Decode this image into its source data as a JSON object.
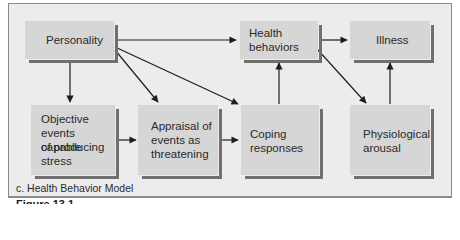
{
  "diagram": {
    "title": "c. Health Behavior Model",
    "figure_label": "Figure 13.1",
    "nodes": [
      {
        "id": "personality",
        "label": "Personality"
      },
      {
        "id": "health_behaviors",
        "label": "Health behaviors",
        "lines": [
          "Health",
          "behaviors"
        ]
      },
      {
        "id": "illness",
        "label": "Illness"
      },
      {
        "id": "objective_events",
        "label": "Objective events capable of producing stress",
        "lines": [
          "Objective",
          "events capable",
          "of producing",
          "stress"
        ]
      },
      {
        "id": "appraisal",
        "label": "Appraisal of events as threatening",
        "lines": [
          "Appraisal of",
          "events as",
          "threatening"
        ]
      },
      {
        "id": "coping",
        "label": "Coping responses",
        "lines": [
          "Coping",
          "responses"
        ]
      },
      {
        "id": "physiological_arousal",
        "label": "Physiological arousal",
        "lines": [
          "Physiological",
          "arousal"
        ]
      }
    ],
    "edges": [
      {
        "from": "personality",
        "to": "health_behaviors"
      },
      {
        "from": "personality",
        "to": "objective_events"
      },
      {
        "from": "personality",
        "to": "appraisal"
      },
      {
        "from": "personality",
        "to": "coping"
      },
      {
        "from": "health_behaviors",
        "to": "illness"
      },
      {
        "from": "health_behaviors",
        "to": "physiological_arousal"
      },
      {
        "from": "objective_events",
        "to": "appraisal"
      },
      {
        "from": "appraisal",
        "to": "coping"
      },
      {
        "from": "coping",
        "to": "health_behaviors"
      },
      {
        "from": "physiological_arousal",
        "to": "illness"
      }
    ],
    "colors": {
      "background": "#ececec",
      "box_fill": "#d6d6d6",
      "box_shadow": "#6f6f6f",
      "arrow": "#1e1e1e",
      "frame_border": "#8a8a8a"
    }
  }
}
